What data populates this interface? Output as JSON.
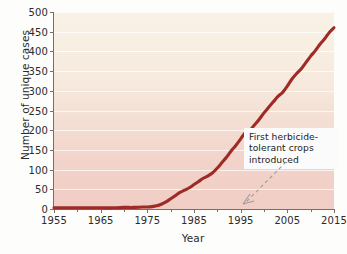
{
  "chart_data": {
    "type": "line",
    "title": "",
    "xlabel": "Year",
    "ylabel": "Number of unique cases",
    "xlim": [
      1955,
      2015
    ],
    "ylim": [
      0,
      500
    ],
    "ytick_values": [
      0,
      50,
      100,
      150,
      200,
      250,
      300,
      350,
      400,
      450,
      500
    ],
    "ytick_labels": [
      "0",
      "50",
      "100",
      "150",
      "200",
      "250",
      "300",
      "350",
      "400",
      "450",
      "500"
    ],
    "xtick_major_values": [
      1955,
      1965,
      1975,
      1985,
      1995,
      2005,
      2015
    ],
    "xtick_major_labels": [
      "1955",
      "1965",
      "1975",
      "1985",
      "1995",
      "2005",
      "2015"
    ],
    "xtick_minor_values": [
      1960,
      1970,
      1980,
      1990,
      2000,
      2010
    ],
    "grid": "horizontal",
    "legend": "none",
    "line_color": "#9e2b26",
    "series": [
      {
        "name": "Number of unique cases",
        "x": [
          1955,
          1960,
          1965,
          1968,
          1970,
          1972,
          1974,
          1975,
          1976,
          1977,
          1978,
          1979,
          1980,
          1981,
          1982,
          1983,
          1984,
          1985,
          1986,
          1987,
          1988,
          1989,
          1990,
          1991,
          1992,
          1993,
          1994,
          1995,
          1996,
          1997,
          1998,
          1999,
          2000,
          2001,
          2002,
          2003,
          2004,
          2005,
          2006,
          2007,
          2008,
          2009,
          2010,
          2011,
          2012,
          2013,
          2014,
          2015
        ],
        "values": [
          3,
          3,
          3,
          3,
          4,
          4,
          5,
          5,
          6,
          8,
          12,
          18,
          26,
          34,
          42,
          48,
          54,
          62,
          70,
          78,
          84,
          92,
          104,
          118,
          132,
          148,
          162,
          178,
          194,
          200,
          214,
          228,
          244,
          258,
          272,
          286,
          296,
          312,
          330,
          344,
          356,
          372,
          388,
          402,
          418,
          432,
          448,
          460
        ]
      }
    ],
    "annotations": [
      {
        "text_lines": [
          "First herbicide-",
          "tolerant crops",
          "introduced"
        ],
        "text": "First herbicide-tolerant crops introduced",
        "points_to_year": 1996,
        "points_to_value": 0
      }
    ]
  }
}
